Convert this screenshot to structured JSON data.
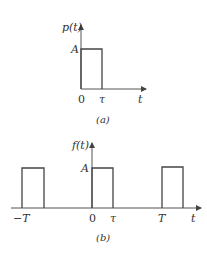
{
  "figure_a": {
    "y_axis_label": "p(t)",
    "x_axis_label": "t",
    "amplitude_label": "A",
    "x_ticks": [
      "0",
      "τ"
    ],
    "caption": "(a)",
    "description": "Single rectangular pulse of height A from t=0 to t=τ"
  },
  "figure_b": {
    "y_axis_label": "f(t)",
    "x_axis_label": "t",
    "amplitude_label": "A",
    "x_ticks": [
      "−T",
      "0",
      "τ",
      "T"
    ],
    "caption": "(b)",
    "description": "Periodic rectangular pulse train of height A, width τ, period T"
  },
  "colors": {
    "line": "#444444",
    "axis": "#555555",
    "text": "#333333",
    "background": "#ffffff"
  }
}
